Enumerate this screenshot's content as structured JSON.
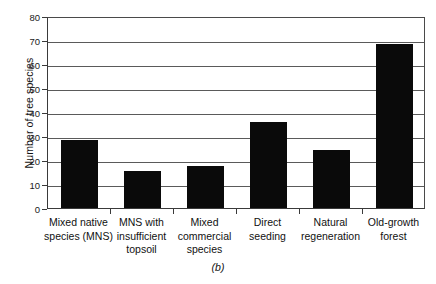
{
  "chart_data": {
    "type": "bar",
    "title": "",
    "subtitle": "",
    "caption": "(b)",
    "xlabel": "",
    "ylabel": "Number of tree species",
    "ylim": [
      0,
      80
    ],
    "ytick_step": 10,
    "yticks": [
      80,
      70,
      60,
      50,
      40,
      30,
      20,
      10,
      0
    ],
    "ytick_labels": [
      "80",
      "70",
      "60",
      "50",
      "40",
      "30",
      "20",
      "10",
      "0"
    ],
    "grid": "horizontal",
    "legend": "none",
    "bar_color": "#0a0a0a",
    "categories": [
      "Mixed native species (MNS)",
      "MNS with insufficient topsoil",
      "Mixed commercial species",
      "Direct seeding",
      "Natural regeneration",
      "Old-growth forest"
    ],
    "category_lines": [
      [
        "Mixed native",
        "species (MNS)"
      ],
      [
        "MNS with",
        "insufficient",
        "topsoil"
      ],
      [
        "Mixed",
        "commercial",
        "species"
      ],
      [
        "Direct",
        "seeding"
      ],
      [
        "Natural",
        "regeneration"
      ],
      [
        "Old-growth",
        "forest"
      ]
    ],
    "values": [
      28.5,
      15.5,
      17.5,
      36,
      24,
      68.5
    ]
  }
}
